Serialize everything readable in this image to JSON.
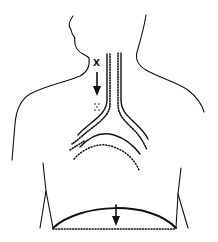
{
  "diagram": {
    "title": "",
    "labels": {
      "x_marker": "X"
    },
    "elements": [
      {
        "name": "body-outline",
        "description": "Head, neck and shoulders silhouette"
      },
      {
        "name": "trachea",
        "description": "Solid outer walls with dotted inner lining"
      },
      {
        "name": "bronchi",
        "description": "Bifurcation into left and right bronchi, solid and dotted lines"
      },
      {
        "name": "x-marker-arrow",
        "description": "Downward arrow below label X pointing to dotted particles"
      },
      {
        "name": "diaphragm",
        "description": "Solid arc with dotted baseline and downward arrow"
      }
    ],
    "colors": {
      "line": "#111111",
      "background": "#ffffff"
    }
  }
}
